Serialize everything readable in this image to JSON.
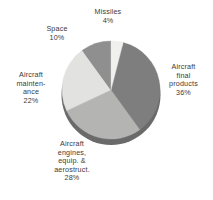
{
  "chart_data": {
    "type": "pie",
    "title": "",
    "subtitle": "",
    "xlabel": "",
    "ylabel": "",
    "legend_position": "none",
    "grid": false,
    "labels_inline": true,
    "categories": [
      "Missiles",
      "Aircraft final products",
      "Aircraft engines, equip. & aerostruct.",
      "Aircraft maintenance",
      "Space"
    ],
    "values": [
      4,
      36,
      28,
      22,
      10
    ],
    "units": "percent",
    "slices": [
      {
        "name": "Missiles",
        "value": 4,
        "value_label": "4%",
        "color": "#f0f0ee",
        "label_lines": [
          "Missiles"
        ],
        "start_angle_deg": 0,
        "end_angle_deg": 14.4
      },
      {
        "name": "Aircraft final products",
        "value": 36,
        "value_label": "36%",
        "color": "#7e7e7e",
        "label_lines": [
          "Aircraft",
          "final",
          "products"
        ],
        "start_angle_deg": 14.4,
        "end_angle_deg": 144
      },
      {
        "name": "Aircraft engines, equip. & aerostruct.",
        "value": 28,
        "value_label": "28%",
        "color": "#b4b4b2",
        "label_lines": [
          "Aircraft",
          "engines,",
          "equip. &",
          "aerostruct."
        ],
        "start_angle_deg": 144,
        "end_angle_deg": 244.8
      },
      {
        "name": "Aircraft maintenance",
        "value": 22,
        "value_label": "22%",
        "color": "#e2e2e0",
        "label_lines": [
          "Aircraft",
          "mainten-",
          "ance"
        ],
        "start_angle_deg": 244.8,
        "end_angle_deg": 324
      },
      {
        "name": "Space",
        "value": 10,
        "value_label": "10%",
        "color": "#8f8f8f",
        "label_lines": [
          "Space"
        ],
        "start_angle_deg": 324,
        "end_angle_deg": 360
      }
    ],
    "style": {
      "rim_color": "#6a6a6a",
      "background": "#ffffff",
      "text_color": "#3a3a3a"
    }
  },
  "labels": {
    "missiles": {
      "l1": "Missiles",
      "pct": "4%"
    },
    "space": {
      "l1": "Space",
      "pct": "10%"
    },
    "maintenance": {
      "l1": "Aircraft",
      "l2": "mainten-",
      "l3": "ance",
      "pct": "22%"
    },
    "engines": {
      "l1": "Aircraft",
      "l2": "engines,",
      "l3": "equip. &",
      "l4": "aerostruct.",
      "pct": "28%"
    },
    "final": {
      "l1": "Aircraft",
      "l2": "final",
      "l3": "products",
      "pct": "36%"
    }
  }
}
